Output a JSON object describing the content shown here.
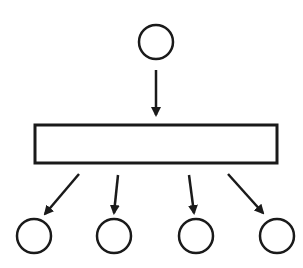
{
  "diagram": {
    "type": "fan-out flow",
    "stroke_color": "#1a1a1a",
    "background": "#ffffff",
    "source_node": {
      "shape": "circle",
      "cx": 156,
      "cy": 42,
      "r": 17
    },
    "input_arrow": {
      "x1": 156,
      "y1": 70,
      "x2": 156,
      "y2": 115
    },
    "process_box": {
      "shape": "rectangle",
      "x": 35,
      "y": 125,
      "width": 242,
      "height": 38
    },
    "output_arrows": [
      {
        "x1": 79,
        "y1": 174,
        "x2": 45,
        "y2": 214
      },
      {
        "x1": 118,
        "y1": 175,
        "x2": 114,
        "y2": 213
      },
      {
        "x1": 189,
        "y1": 175,
        "x2": 194,
        "y2": 213
      },
      {
        "x1": 228,
        "y1": 174,
        "x2": 263,
        "y2": 213
      }
    ],
    "output_nodes": [
      {
        "shape": "circle",
        "cx": 34,
        "cy": 236,
        "r": 17
      },
      {
        "shape": "circle",
        "cx": 114,
        "cy": 236,
        "r": 17
      },
      {
        "shape": "circle",
        "cx": 196,
        "cy": 236,
        "r": 17
      },
      {
        "shape": "circle",
        "cx": 277,
        "cy": 236,
        "r": 17
      }
    ]
  }
}
